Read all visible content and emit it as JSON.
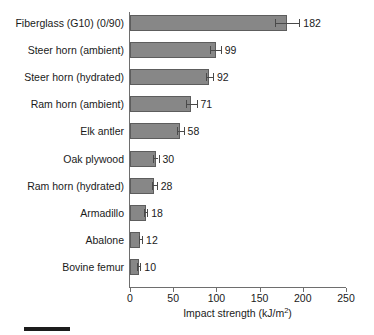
{
  "chart_data": {
    "type": "bar",
    "orientation": "horizontal",
    "title": "",
    "subtitle": "",
    "xlabel": "Impact strength (kJ/m2)",
    "xlabel_display": "Impact strength (kJ/m",
    "xlabel_superscript": "2",
    "xlabel_suffix": ")",
    "ylabel": "",
    "xlim": [
      0,
      250
    ],
    "xticks": [
      0,
      50,
      100,
      150,
      200,
      250
    ],
    "xticklabels": [
      "0",
      "50",
      "100",
      "150",
      "200",
      "250"
    ],
    "grid": false,
    "legend": false,
    "bar_color": "#878787",
    "bar_edge_color": "#5d5d5d",
    "error_color": "#4a4a4a",
    "axis_color": "#6e6e6e",
    "categories": [
      "Fiberglass (G10) (0/90)",
      "Steer horn (ambient)",
      "Steer horn (hydrated)",
      "Ram horn (ambient)",
      "Elk antler",
      "Oak plywood",
      "Ram horn (hydrated)",
      "Armadillo",
      "Abalone",
      "Bovine femur"
    ],
    "values": [
      182,
      99,
      92,
      71,
      58,
      30,
      28,
      18,
      12,
      10
    ],
    "value_labels": [
      "182",
      "99",
      "92",
      "71",
      "58",
      "30",
      "28",
      "18",
      "12",
      "10"
    ],
    "errors": [
      14,
      6,
      4,
      6,
      4,
      3,
      3,
      2,
      2,
      2
    ],
    "points": [
      {
        "category": "Fiberglass (G10) (0/90)",
        "value": 182,
        "error": 14
      },
      {
        "category": "Steer horn (ambient)",
        "value": 99,
        "error": 6
      },
      {
        "category": "Steer horn (hydrated)",
        "value": 92,
        "error": 4
      },
      {
        "category": "Ram horn (ambient)",
        "value": 71,
        "error": 6
      },
      {
        "category": "Elk antler",
        "value": 58,
        "error": 4
      },
      {
        "category": "Oak plywood",
        "value": 30,
        "error": 3
      },
      {
        "category": "Ram horn (hydrated)",
        "value": 28,
        "error": 3
      },
      {
        "category": "Armadillo",
        "value": 18,
        "error": 2
      },
      {
        "category": "Abalone",
        "value": 12,
        "error": 2
      },
      {
        "category": "Bovine femur",
        "value": 10,
        "error": 2
      }
    ]
  },
  "figure": {
    "scale_bar_present": true
  }
}
